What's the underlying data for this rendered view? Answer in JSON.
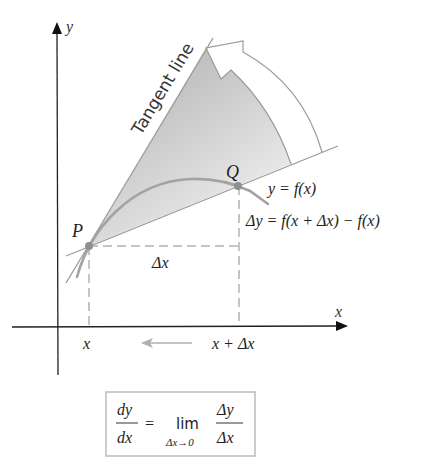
{
  "diagram": {
    "axes": {
      "x_label": "x",
      "y_label": "y"
    },
    "points": {
      "P_label": "P",
      "Q_label": "Q"
    },
    "tangent_label": "Tangent line",
    "curve_label": "y = f(x)",
    "delta_y_label": "Δy = f(x + Δx) − f(x)",
    "delta_x_label": "Δx",
    "x_tick_label": "x",
    "x_plus_dx_tick_label": "x + Δx",
    "formula": {
      "lhs_num": "dy",
      "lhs_den": "dx",
      "equals": "=",
      "lim": "lim",
      "lim_sub": "Δx→0",
      "rhs_num": "Δy",
      "rhs_den": "Δx"
    },
    "colors": {
      "curve": "#a0a0a0",
      "lines": "#9a9a9a",
      "axes": "#222222",
      "shade_dark": "#b5b5b5",
      "shade_light": "#f4f4f4",
      "box_border": "#bcbcbc",
      "point": "#8f8f8f"
    }
  }
}
